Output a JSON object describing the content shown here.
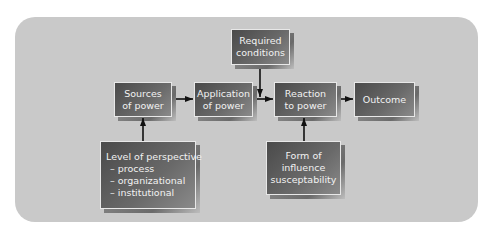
{
  "diagram": {
    "nodes": {
      "sources": {
        "lines": [
          "Sources",
          "of power"
        ]
      },
      "application": {
        "lines": [
          "Application",
          "of power"
        ]
      },
      "required": {
        "lines": [
          "Required",
          "conditions"
        ]
      },
      "reaction": {
        "lines": [
          "Reaction",
          "to power"
        ]
      },
      "outcome": {
        "lines": [
          "Outcome"
        ]
      },
      "level": {
        "lines": [
          "Level of perspective",
          "– process",
          "– organizational",
          "– institutional"
        ]
      },
      "form": {
        "lines": [
          "Form of",
          "influence",
          "susceptability"
        ]
      }
    },
    "edges": [
      {
        "from": "Sources of power",
        "to": "Application of power"
      },
      {
        "from": "Application of power",
        "to": "Reaction to power"
      },
      {
        "from": "Required conditions",
        "to": "Application-Reaction link"
      },
      {
        "from": "Reaction to power",
        "to": "Outcome"
      },
      {
        "from": "Level of perspective",
        "to": "Sources of power"
      },
      {
        "from": "Form of influence susceptability",
        "to": "Reaction to power"
      }
    ],
    "colors": {
      "panel": "#c9c9c9",
      "box_dark": "#4a4a4a",
      "box_text": "#f2f2f2",
      "arrow": "#111111"
    }
  }
}
